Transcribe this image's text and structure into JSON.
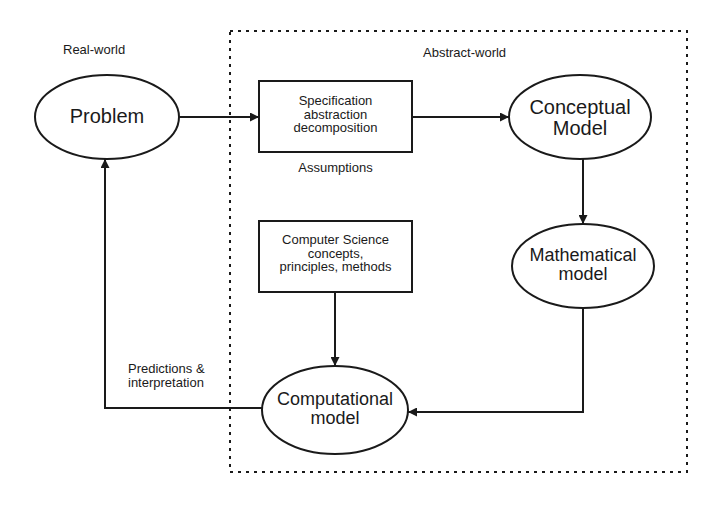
{
  "regions": {
    "real_world": "Real-world",
    "abstract_world": "Abstract-world"
  },
  "nodes": {
    "problem": "Problem",
    "specification": [
      "Specification",
      "abstraction",
      "decomposition"
    ],
    "assumptions": "Assumptions",
    "conceptual": [
      "Conceptual",
      "Model"
    ],
    "mathematical": [
      "Mathematical",
      "model"
    ],
    "cs": [
      "Computer Science",
      "concepts,",
      "principles, methods"
    ],
    "computational": [
      "Computational",
      "model"
    ]
  },
  "edges": {
    "predictions": [
      "Predictions &",
      "interpretation"
    ]
  },
  "colors": {
    "stroke": "#1a1a1a",
    "background": "#ffffff"
  }
}
